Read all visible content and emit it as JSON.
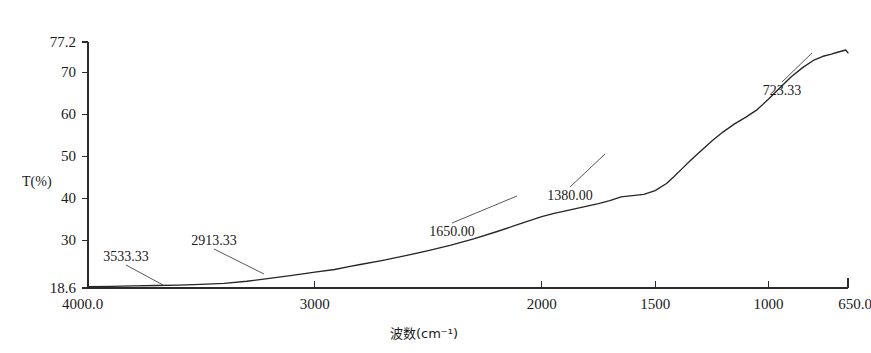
{
  "chart_data": {
    "type": "line",
    "title": "",
    "xlabel": "波数(cm⁻¹)",
    "ylabel": "T(%)",
    "xlim": [
      4000.0,
      650.0
    ],
    "ylim": [
      18.6,
      77.2
    ],
    "x_inverted": true,
    "grid": false,
    "legend": "none",
    "xticks": [
      "4000.0",
      "3000",
      "2000",
      "1500",
      "1000",
      "650.0"
    ],
    "xtick_values": [
      4000,
      3000,
      2000,
      1500,
      1000,
      650
    ],
    "yticks": [
      "77.2",
      "70",
      "60",
      "50",
      "40",
      "30",
      "18.6"
    ],
    "ytick_values": [
      77.2,
      70,
      60,
      50,
      40,
      30,
      18.6
    ],
    "series": [
      {
        "name": "transmittance",
        "x": [
          4000,
          3900,
          3800,
          3700,
          3600,
          3533,
          3450,
          3400,
          3300,
          3200,
          3100,
          3000,
          2913,
          2850,
          2800,
          2700,
          2600,
          2500,
          2400,
          2300,
          2200,
          2100,
          2000,
          1950,
          1900,
          1850,
          1800,
          1750,
          1700,
          1650,
          1600,
          1550,
          1500,
          1450,
          1420,
          1380,
          1340,
          1300,
          1250,
          1200,
          1150,
          1100,
          1050,
          1000,
          950,
          900,
          850,
          800,
          760,
          723,
          700,
          680,
          660,
          650
        ],
        "y": [
          18.9,
          19.0,
          19.1,
          19.2,
          19.3,
          19.4,
          19.6,
          19.7,
          20.2,
          20.9,
          21.6,
          22.4,
          23.0,
          23.7,
          24.2,
          25.2,
          26.3,
          27.5,
          28.8,
          30.3,
          32.0,
          33.8,
          35.6,
          36.3,
          36.9,
          37.5,
          38.1,
          38.7,
          39.4,
          40.3,
          40.6,
          40.9,
          41.8,
          43.5,
          45.0,
          47.1,
          49.2,
          51.2,
          53.6,
          55.8,
          57.7,
          59.3,
          61.1,
          63.6,
          66.3,
          68.9,
          71.1,
          72.9,
          73.8,
          74.3,
          74.7,
          75.0,
          75.3,
          74.6
        ]
      }
    ],
    "annotations": [
      {
        "label": "3533.33",
        "wavenumber": 3533.33,
        "text_x": 126,
        "text_y": 261,
        "point_x": 163,
        "point_y": 285
      },
      {
        "label": "2913.33",
        "wavenumber": 2913.33,
        "text_x": 214,
        "text_y": 245,
        "point_x": 264,
        "point_y": 274
      },
      {
        "label": "1650.00",
        "wavenumber": 1650.0,
        "text_x": 452,
        "text_y": 236,
        "point_x": 517,
        "point_y": 196
      },
      {
        "label": "1380.00",
        "wavenumber": 1380.0,
        "text_x": 570,
        "text_y": 200,
        "point_x": 605,
        "point_y": 154
      },
      {
        "label": "723.33",
        "wavenumber": 723.33,
        "text_x": 782,
        "text_y": 95,
        "point_x": 812,
        "point_y": 53
      }
    ],
    "colors": {
      "curve": "#262626",
      "axis": "#2b2b2b",
      "background": "#ffffff",
      "text": "#1a1a1a"
    }
  }
}
